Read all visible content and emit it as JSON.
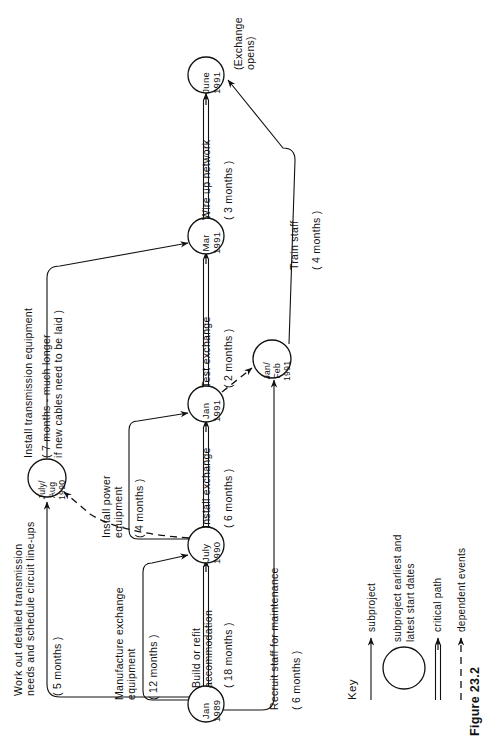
{
  "figure": {
    "caption": "Figure 23.2"
  },
  "diagram": {
    "type": "project-network-diagram",
    "orientation": "rotated-90-ccw",
    "nodes": [
      {
        "id": "jan1989",
        "label": "Jan\n1989",
        "lines": [
          "Jan",
          "1989"
        ]
      },
      {
        "id": "july1990",
        "label": "July\n1990",
        "lines": [
          "July",
          "1990"
        ]
      },
      {
        "id": "jan1991",
        "label": "Jan\n1991",
        "lines": [
          "Jan",
          "1991"
        ]
      },
      {
        "id": "mar1991",
        "label": "Mar\n1991",
        "lines": [
          "Mar",
          "1991"
        ]
      },
      {
        "id": "june1991",
        "label": "June\n1991",
        "lines": [
          "June",
          "1991"
        ]
      },
      {
        "id": "julyaug1990",
        "label": "July/\nAug\n1990",
        "lines": [
          "July/",
          "Aug",
          "1990"
        ]
      },
      {
        "id": "janfeb1991",
        "label": "Jan/\nFeb\n1991",
        "lines": [
          "Jan/",
          "Feb",
          "1991"
        ]
      }
    ],
    "edges": [
      {
        "id": "build",
        "from": "jan1989",
        "to": "july1990",
        "label": "Build or refit\naccommodation",
        "label_lines": [
          "Build or refit",
          "accommodation"
        ],
        "duration": "( 18 months )",
        "kind": "critical path"
      },
      {
        "id": "install-exch",
        "from": "july1990",
        "to": "jan1991",
        "label": "Install exchange",
        "label_lines": [
          "Install exchange"
        ],
        "duration": "( 6 months )",
        "kind": "critical path"
      },
      {
        "id": "test-exch",
        "from": "jan1991",
        "to": "mar1991",
        "label": "Test exchange",
        "label_lines": [
          "Test exchange"
        ],
        "duration": "( 2 months )",
        "kind": "critical path"
      },
      {
        "id": "wire-up",
        "from": "mar1991",
        "to": "june1991",
        "label": "Wire up network",
        "label_lines": [
          "Wire up network"
        ],
        "duration": "( 3 months )",
        "kind": "critical path"
      },
      {
        "id": "manufacture",
        "from": "jan1989",
        "to": "july1990",
        "label": "Manufacture exchange\nequipment",
        "label_lines": [
          "Manufacture exchange",
          "equipment"
        ],
        "duration": "( 12 months )",
        "kind": "subproject"
      },
      {
        "id": "workout",
        "from": "jan1989",
        "to": "julyaug1990",
        "label": "Work out detailed transmission\nneeds and schedule circuit line-ups",
        "label_lines": [
          "Work out detailed transmission",
          "needs and schedule circuit line-ups"
        ],
        "duration": "( 5 months )",
        "kind": "subproject"
      },
      {
        "id": "install-power",
        "from": "july1990",
        "to": "jan1991",
        "label": "Install power\nequipment",
        "label_lines": [
          "Install power",
          "equipment"
        ],
        "duration": "( 4 months )",
        "kind": "subproject"
      },
      {
        "id": "install-trans",
        "from": "julyaug1990",
        "to": "mar1991",
        "label": "Install transmission equipment",
        "label_lines": [
          "Install transmission equipment"
        ],
        "duration": "( 7 months - much longer\nif new cables need to be laid )",
        "duration_lines": [
          "( 7 months - much longer",
          "if new cables need to be laid )"
        ],
        "kind": "subproject"
      },
      {
        "id": "recruit",
        "from": "jan1989",
        "to": "janfeb1991",
        "label": "Recruit staff for maintenance",
        "label_lines": [
          "Recruit staff for maintenance"
        ],
        "duration": "( 6 months )",
        "kind": "subproject"
      },
      {
        "id": "train",
        "from": "janfeb1991",
        "to": "june1991",
        "label": "Train staff",
        "label_lines": [
          "Train staff"
        ],
        "duration": "( 4 months )",
        "kind": "subproject"
      },
      {
        "id": "dependency",
        "from": "july1990",
        "to": "julyaug1990",
        "label": "",
        "label_lines": [],
        "duration": "",
        "kind": "dependent events"
      },
      {
        "id": "dependency2",
        "from": "jan1991",
        "to": "janfeb1991",
        "label": "",
        "label_lines": [],
        "duration": "",
        "kind": "dependent events"
      }
    ],
    "annotations": [
      {
        "id": "exchange-opens",
        "text": "(Exchange\nopens)",
        "lines": [
          "(Exchange",
          "opens)"
        ],
        "near": "june1991"
      }
    ]
  },
  "key": {
    "title": "Key",
    "items": [
      {
        "id": "key-subproject",
        "symbol": "single-arrow",
        "label": "subproject",
        "label_lines": [
          "subproject"
        ]
      },
      {
        "id": "key-dates",
        "symbol": "circle",
        "label": "subproject earliest and\nlatest start dates",
        "label_lines": [
          "subproject earliest and",
          "latest start dates"
        ]
      },
      {
        "id": "key-critical",
        "symbol": "double-arrow",
        "label": "critical path",
        "label_lines": [
          "critical path"
        ]
      },
      {
        "id": "key-dependent",
        "symbol": "dashed-arrow",
        "label": "dependent events",
        "label_lines": [
          "dependent events"
        ]
      }
    ]
  },
  "colors": {
    "ink": "#111111",
    "background": "#ffffff"
  }
}
